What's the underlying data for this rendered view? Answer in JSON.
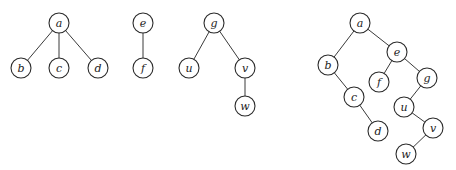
{
  "diagram": {
    "node_radius": 10,
    "forest": {
      "nodes": [
        {
          "id": "fa",
          "label": "a",
          "x": 59,
          "y": 23
        },
        {
          "id": "fb",
          "label": "b",
          "x": 21,
          "y": 68
        },
        {
          "id": "fc",
          "label": "c",
          "x": 59,
          "y": 68
        },
        {
          "id": "fd",
          "label": "d",
          "x": 98,
          "y": 68
        },
        {
          "id": "fe",
          "label": "e",
          "x": 143,
          "y": 23
        },
        {
          "id": "ff",
          "label": "f",
          "x": 143,
          "y": 68
        },
        {
          "id": "fg",
          "label": "g",
          "x": 214,
          "y": 23
        },
        {
          "id": "fu",
          "label": "u",
          "x": 189,
          "y": 68
        },
        {
          "id": "fv",
          "label": "v",
          "x": 245,
          "y": 68
        },
        {
          "id": "fw",
          "label": "w",
          "x": 245,
          "y": 106
        }
      ],
      "edges": [
        [
          "fa",
          "fb"
        ],
        [
          "fa",
          "fc"
        ],
        [
          "fa",
          "fd"
        ],
        [
          "fe",
          "ff"
        ],
        [
          "fg",
          "fu"
        ],
        [
          "fg",
          "fv"
        ],
        [
          "fv",
          "fw"
        ]
      ]
    },
    "binary_tree": {
      "nodes": [
        {
          "id": "ta",
          "label": "a",
          "x": 360,
          "y": 23
        },
        {
          "id": "tb",
          "label": "b",
          "x": 328,
          "y": 65
        },
        {
          "id": "te",
          "label": "e",
          "x": 397,
          "y": 52
        },
        {
          "id": "tf",
          "label": "f",
          "x": 379,
          "y": 82
        },
        {
          "id": "tg",
          "label": "g",
          "x": 427,
          "y": 78
        },
        {
          "id": "tc",
          "label": "c",
          "x": 354,
          "y": 97
        },
        {
          "id": "tu",
          "label": "u",
          "x": 404,
          "y": 107
        },
        {
          "id": "td",
          "label": "d",
          "x": 378,
          "y": 131
        },
        {
          "id": "tv",
          "label": "v",
          "x": 433,
          "y": 128
        },
        {
          "id": "tw",
          "label": "w",
          "x": 406,
          "y": 154
        }
      ],
      "edges": [
        [
          "ta",
          "tb"
        ],
        [
          "ta",
          "te"
        ],
        [
          "tb",
          "tc"
        ],
        [
          "tc",
          "td"
        ],
        [
          "te",
          "tf"
        ],
        [
          "te",
          "tg"
        ],
        [
          "tg",
          "tu"
        ],
        [
          "tu",
          "tv"
        ],
        [
          "tv",
          "tw"
        ]
      ]
    }
  }
}
